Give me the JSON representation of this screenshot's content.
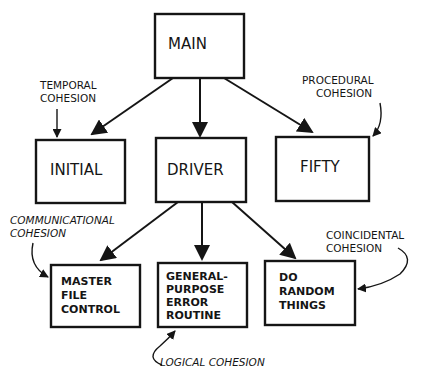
{
  "diagram": {
    "type": "structure-chart",
    "modules": {
      "main": {
        "lines": [
          "MAIN"
        ]
      },
      "initial": {
        "lines": [
          "INITIAL"
        ]
      },
      "driver": {
        "lines": [
          "DRIVER"
        ]
      },
      "fifty": {
        "lines": [
          "FIFTY"
        ]
      },
      "master_file_control": {
        "lines": [
          "MASTER",
          "FILE",
          "CONTROL"
        ]
      },
      "general_purpose_error_routine": {
        "lines": [
          "GENERAL-",
          "PURPOSE",
          "ERROR",
          "ROUTINE"
        ]
      },
      "do_random_things": {
        "lines": [
          "DO",
          "RANDOM",
          "THINGS"
        ]
      }
    },
    "calls": [
      {
        "from": "main",
        "to": "initial"
      },
      {
        "from": "main",
        "to": "driver"
      },
      {
        "from": "main",
        "to": "fifty"
      },
      {
        "from": "driver",
        "to": "master_file_control"
      },
      {
        "from": "driver",
        "to": "general_purpose_error_routine"
      },
      {
        "from": "driver",
        "to": "do_random_things"
      }
    ],
    "annotations": {
      "temporal": {
        "lines": [
          "TEMPORAL",
          "COHESION"
        ],
        "target": "initial"
      },
      "procedural": {
        "lines": [
          "PROCEDURAL",
          "COHESION"
        ],
        "target": "fifty"
      },
      "communicational": {
        "lines": [
          "COMMUNICATIONAL",
          "COHESION"
        ],
        "target": "master_file_control"
      },
      "coincidental": {
        "lines": [
          "COINCIDENTAL",
          "COHESION"
        ],
        "target": "do_random_things"
      },
      "logical": {
        "lines": [
          "LOGICAL COHESION"
        ],
        "target": "general_purpose_error_routine"
      }
    }
  }
}
